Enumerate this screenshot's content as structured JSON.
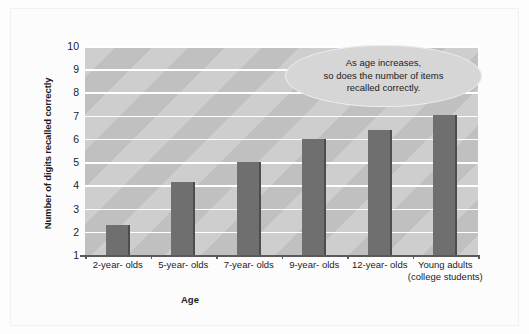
{
  "chart_data": {
    "type": "bar",
    "title": "",
    "subtitle": "",
    "xlabel": "Age",
    "ylabel": "Number of digits recalled correctly",
    "categories": [
      "2-year-\nolds",
      "5-year-\nolds",
      "7-year-\nolds",
      "9-year-\nolds",
      "12-year-\nolds",
      "Young adults\n(college\nstudents)"
    ],
    "values": [
      2.3,
      4.15,
      5.0,
      6.0,
      6.4,
      7.05
    ],
    "ylim": [
      1,
      10
    ],
    "yticks": [
      10,
      9,
      8,
      7,
      6,
      5,
      4,
      3,
      2,
      1
    ],
    "grid": "horizontal",
    "legend": "none",
    "annotations": [
      {
        "name": "callout",
        "text": "As age increases,\nso does  the number of items\nrecalled correctly.",
        "shape": "ellipse"
      }
    ]
  },
  "colors": {
    "bar_fill": "#6f6f6f",
    "bar_edge": "#4d4d4d",
    "plot_background": "#c0c0c0",
    "gridline": "#ffffff",
    "callout_fill": "#d6d6d6",
    "text": "#1c1c1c",
    "page_background": "#fdfdfd"
  }
}
